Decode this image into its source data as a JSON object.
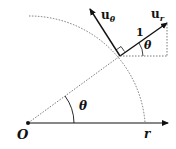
{
  "diagram": {
    "labels": {
      "origin": "O",
      "axis": "r",
      "angle_main": "θ",
      "angle_small": "θ",
      "unit_length": "1",
      "u_r_base": "u",
      "u_r_sub": "r",
      "u_theta_base": "u",
      "u_theta_sub": "θ"
    },
    "colors": {
      "stroke": "#111111",
      "dotted": "#555555"
    }
  }
}
